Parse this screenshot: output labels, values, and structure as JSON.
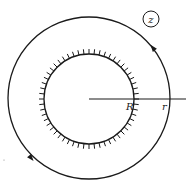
{
  "diagram": {
    "type": "contour-integration-annulus",
    "stroke_color": "#1a1a1a",
    "background": "#ffffff",
    "plane_label": "z",
    "outer_contour": {
      "center": [
        89,
        98
      ],
      "radius": 81,
      "direction": "counterclockwise",
      "arrows": [
        {
          "position": [
            153,
            48
          ],
          "angle_deg": -128
        },
        {
          "position": [
            31,
            158
          ],
          "angle_deg": 50
        }
      ]
    },
    "inner_boundary": {
      "center": [
        89,
        99
      ],
      "radius": 45,
      "hatched": true,
      "hatch_count": 56,
      "hatch_length": 5,
      "hatch_direction": "outward"
    },
    "radius_line": {
      "from": [
        89,
        99
      ],
      "to": [
        186,
        99
      ]
    },
    "labels": {
      "inner_radius": "R",
      "outer_radius": "r"
    }
  }
}
